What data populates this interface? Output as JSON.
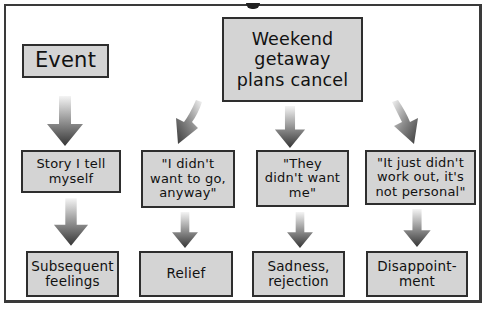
{
  "diagram": {
    "title_fragment": "",
    "header": {
      "event_label": "Event",
      "trigger_label": "Weekend\ngetaway\nplans cancel"
    },
    "row_label_story": "Story I tell\nmyself",
    "row_label_feelings": "Subsequent\nfeelings",
    "stories": [
      "\"I didn't\nwant to go,\nanyway\"",
      "\"They\ndidn't want\nme\"",
      "\"It just didn't\nwork out, it's\nnot personal\""
    ],
    "feelings": [
      "Relief",
      "Sadness,\nrejection",
      "Disappoint-\nment"
    ],
    "colors": {
      "box_fill": "#d4d4d4",
      "box_border": "#2e2e2e",
      "arrow_dark": "#3c3c3c",
      "arrow_light": "#f2f2f2",
      "frame": "#3a3a3a"
    },
    "edges": [
      {
        "from": "Event",
        "to": "Story I tell myself"
      },
      {
        "from": "Story I tell myself",
        "to": "Subsequent feelings"
      },
      {
        "from": "Weekend getaway plans cancel",
        "to": "\"I didn't want to go, anyway\""
      },
      {
        "from": "Weekend getaway plans cancel",
        "to": "\"They didn't want me\""
      },
      {
        "from": "Weekend getaway plans cancel",
        "to": "\"It just didn't work out, it's not personal\""
      },
      {
        "from": "\"I didn't want to go, anyway\"",
        "to": "Relief"
      },
      {
        "from": "\"They didn't want me\"",
        "to": "Sadness, rejection"
      },
      {
        "from": "\"It just didn't work out, it's not personal\"",
        "to": "Disappointment"
      }
    ]
  }
}
